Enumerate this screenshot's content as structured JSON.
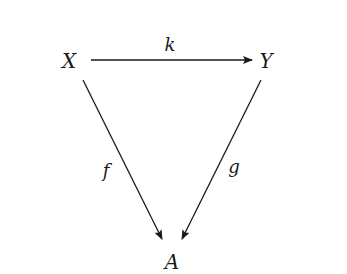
{
  "diagram": {
    "type": "commutative-triangle",
    "nodes": [
      {
        "id": "X",
        "label": "X"
      },
      {
        "id": "Y",
        "label": "Y"
      },
      {
        "id": "A",
        "label": "A"
      }
    ],
    "edges": [
      {
        "from": "X",
        "to": "Y",
        "label": "k"
      },
      {
        "from": "X",
        "to": "A",
        "label": "f"
      },
      {
        "from": "Y",
        "to": "A",
        "label": "g"
      }
    ],
    "colors": {
      "ink": "#1a1a1a",
      "background": "#ffffff"
    }
  }
}
